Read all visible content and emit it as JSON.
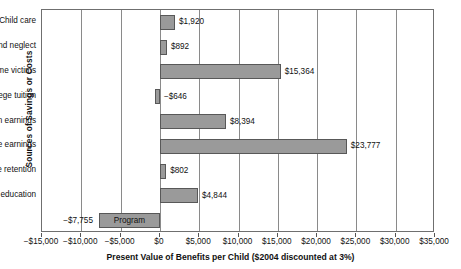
{
  "chart_data": {
    "type": "bar",
    "orientation": "horizontal",
    "title": "",
    "xlabel": "Present Value of Benefits per Child ($2004 discounted at 3%)",
    "ylabel": "Sources of Savings or Costs",
    "xlim": [
      -15000,
      35000
    ],
    "xticks": [
      -15000,
      -10000,
      -5000,
      0,
      5000,
      10000,
      15000,
      20000,
      25000,
      30000,
      35000
    ],
    "xticklabels": [
      "−$15,000",
      "−$10,000",
      "−$5,000",
      "$0",
      "$5,000",
      "$10,000",
      "$15,000",
      "$20,000",
      "$25,000",
      "$30,000",
      "$35,000"
    ],
    "grid": true,
    "legend": false,
    "bar_color": "#9a9a9a",
    "bar_edge_color": "#585858",
    "categories": [
      "Child care",
      "Abuse and neglect",
      "Justice system/crime victims",
      "College tuition",
      "Taxes on earnings",
      "Lifetime earnings",
      "Grade retention",
      "Special education",
      "Program"
    ],
    "values": [
      1920,
      892,
      15364,
      -646,
      8394,
      23777,
      802,
      4844,
      -7755
    ],
    "datalabels": [
      "$1,920",
      "$892",
      "$15,364",
      "−$646",
      "$8,394",
      "$23,777",
      "$802",
      "$4,844",
      "−$7,755"
    ],
    "bars": [
      {
        "category": "Child care",
        "value": 1920,
        "label": "$1,920",
        "label_side": "right",
        "label_in_bar": false
      },
      {
        "category": "Abuse and neglect",
        "value": 892,
        "label": "$892",
        "label_side": "right",
        "label_in_bar": false
      },
      {
        "category": "Justice system/crime victims",
        "value": 15364,
        "label": "$15,364",
        "label_side": "right",
        "label_in_bar": false
      },
      {
        "category": "College tuition",
        "value": -646,
        "label": "−$646",
        "label_side": "right",
        "label_in_bar": false
      },
      {
        "category": "Taxes on earnings",
        "value": 8394,
        "label": "$8,394",
        "label_side": "right",
        "label_in_bar": false
      },
      {
        "category": "Lifetime earnings",
        "value": 23777,
        "label": "$23,777",
        "label_side": "right",
        "label_in_bar": false
      },
      {
        "category": "Grade retention",
        "value": 802,
        "label": "$802",
        "label_side": "right",
        "label_in_bar": false
      },
      {
        "category": "Special education",
        "value": 4844,
        "label": "$4,844",
        "label_side": "right",
        "label_in_bar": false
      },
      {
        "category": "Program",
        "value": -7755,
        "label": "−$7,755",
        "label_side": "left",
        "label_in_bar": true
      }
    ]
  }
}
